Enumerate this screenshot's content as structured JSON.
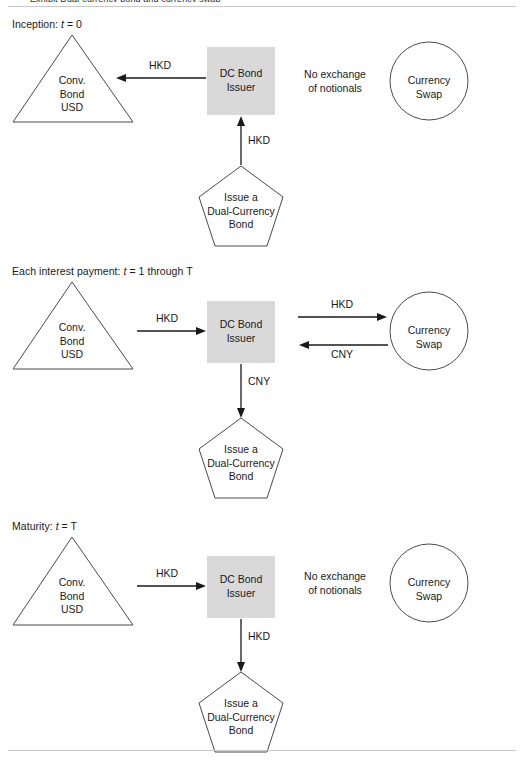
{
  "document": {
    "caption_cut_off": "Exhibit  Dual-currency bond and currency swap",
    "top_rule": true,
    "bottom_rule": true
  },
  "colors": {
    "stroke": "#4a4a4a",
    "arrow": "#1a1a1a",
    "issuer_fill": "#d9d9d9",
    "text": "#1a1a1a",
    "rule": "#c9c9c9"
  },
  "shapes": {
    "conv_bond": {
      "line1": "Conv.",
      "line2": "Bond",
      "line3": "USD"
    },
    "issuer": {
      "line1": "DC Bond",
      "line2": "Issuer"
    },
    "swap": {
      "line1": "Currency",
      "line2": "Swap"
    },
    "pentagon": {
      "line1": "Issue a",
      "line2": "Dual-Currency",
      "line3": "Bond"
    },
    "no_exchange": {
      "line1": "No exchange",
      "line2": "of notionals"
    }
  },
  "panels": [
    {
      "id": "inception",
      "title_prefix": "Inception: ",
      "title_var": "t",
      "title_suffix": " = 0",
      "bond_to_issuer_arrow": {
        "label": "HKD",
        "direction": "left",
        "name": "arrow-issuer-to-bond-hkd"
      },
      "pentagon_arrow": {
        "label": "HKD",
        "direction": "up",
        "name": "arrow-pentagon-to-issuer-hkd"
      },
      "swap_note": "No exchange of notionals",
      "swap_arrows": []
    },
    {
      "id": "interest",
      "title_prefix": "Each interest payment: ",
      "title_var": "t",
      "title_suffix": " = 1 through T",
      "bond_to_issuer_arrow": {
        "label": "HKD",
        "direction": "right",
        "name": "arrow-bond-to-issuer-hkd"
      },
      "pentagon_arrow": {
        "label": "CNY",
        "direction": "down",
        "name": "arrow-issuer-to-pentagon-cny"
      },
      "swap_note": null,
      "swap_arrows": [
        {
          "label": "HKD",
          "direction": "right",
          "name": "arrow-issuer-to-swap-hkd"
        },
        {
          "label": "CNY",
          "direction": "left",
          "name": "arrow-swap-to-issuer-cny"
        }
      ]
    },
    {
      "id": "maturity",
      "title_prefix": "Maturity: ",
      "title_var": "t",
      "title_suffix": " = T",
      "bond_to_issuer_arrow": {
        "label": "HKD",
        "direction": "right",
        "name": "arrow-bond-to-issuer-hkd"
      },
      "pentagon_arrow": {
        "label": "HKD",
        "direction": "down",
        "name": "arrow-issuer-to-pentagon-hkd"
      },
      "swap_note": "No exchange of notionals",
      "swap_arrows": []
    }
  ]
}
